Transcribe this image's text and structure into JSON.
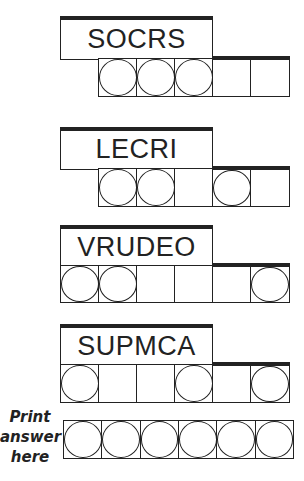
{
  "puzzles": [
    {
      "scrambled": "SOCRS",
      "cells": 5,
      "circled": [
        1,
        1,
        1,
        0,
        0
      ]
    },
    {
      "scrambled": "LECRI",
      "cells": 5,
      "circled": [
        1,
        1,
        0,
        1,
        0
      ]
    },
    {
      "scrambled": "VRUDEO",
      "cells": 6,
      "circled": [
        1,
        1,
        0,
        0,
        0,
        1
      ]
    },
    {
      "scrambled": "SUPMCA",
      "cells": 6,
      "circled": [
        1,
        0,
        0,
        1,
        0,
        1
      ]
    }
  ],
  "answer": {
    "label_line1": "Print",
    "label_line2": "answer",
    "label_line3": "here",
    "cells": 6
  },
  "colors": {
    "ink": "#222222",
    "background": "#ffffff"
  }
}
